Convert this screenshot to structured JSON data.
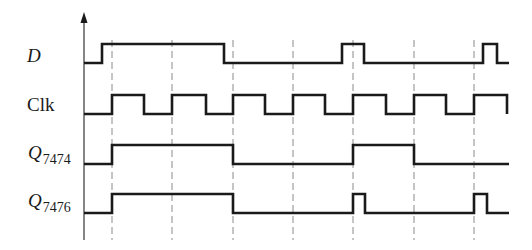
{
  "diagram": {
    "colors": {
      "background": "#ffffff",
      "signal": "#1a1a1a",
      "axis": "#444444",
      "gridline": "#8a8a8a"
    },
    "axis": {
      "x": 84,
      "y_top": 12,
      "y_bottom": 240
    },
    "clock_edges_x": [
      112,
      172,
      233,
      293,
      353,
      414,
      474
    ],
    "gridline_y_range": [
      40,
      240
    ],
    "signals": [
      {
        "id": "D",
        "label": "D",
        "subscript": "",
        "italic": true,
        "label_pos": {
          "x": 27,
          "y": 46
        },
        "high_y": 44,
        "low_y": 63,
        "start_x": 84,
        "end_x": 509,
        "initial": 0,
        "transitions": [
          102,
          224,
          342,
          364,
          483,
          497
        ]
      },
      {
        "id": "Clk",
        "label": "Clk",
        "subscript": "",
        "italic": false,
        "label_pos": {
          "x": 27,
          "y": 95
        },
        "high_y": 95,
        "low_y": 114,
        "start_x": 84,
        "end_x": 507,
        "initial": 0,
        "transitions": [
          112,
          144,
          172,
          206,
          233,
          265,
          293,
          325,
          353,
          386,
          414,
          446,
          474,
          507
        ]
      },
      {
        "id": "Q7474",
        "label": "Q",
        "subscript": "7474",
        "italic": true,
        "label_pos": {
          "x": 28,
          "y": 143
        },
        "high_y": 145,
        "low_y": 164,
        "start_x": 84,
        "end_x": 509,
        "initial": 0,
        "transitions": [
          112,
          233,
          353,
          414
        ]
      },
      {
        "id": "Q7476",
        "label": "Q",
        "subscript": "7476",
        "italic": true,
        "label_pos": {
          "x": 28,
          "y": 191
        },
        "high_y": 194,
        "low_y": 213,
        "start_x": 84,
        "end_x": 509,
        "initial": 0,
        "transitions": [
          112,
          233,
          353,
          365,
          474,
          487
        ]
      }
    ]
  }
}
